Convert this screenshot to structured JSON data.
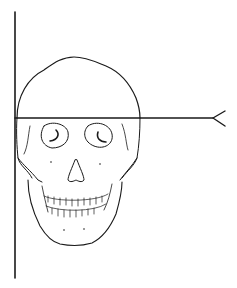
{
  "figure": {
    "colors": {
      "line": "#1a1a1a",
      "background": "#ffffff"
    },
    "vertical_line": {
      "x": 15,
      "y1": 12,
      "y2": 278
    },
    "horizontal_line": {
      "y": 118,
      "x1": 15,
      "x2": 213,
      "end": "forked-arrow-tail"
    }
  }
}
